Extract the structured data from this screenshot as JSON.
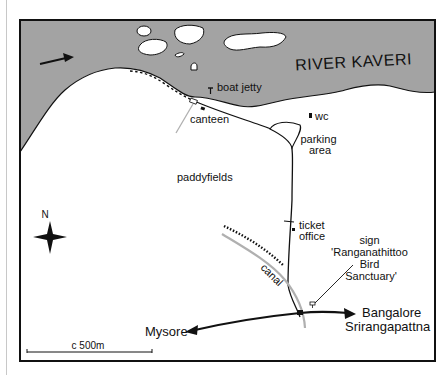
{
  "map": {
    "river_label": "RIVER KAVERI",
    "labels": {
      "boat_jetty": "boat jetty",
      "canteen": "canteen",
      "wc": "wc",
      "parking_1": "parking",
      "parking_2": "area",
      "paddyfields": "paddyfields",
      "ticket_1": "ticket",
      "ticket_2": "office",
      "sign_1": "sign",
      "sign_2": "'Ranganathittoo",
      "sign_3": "Bird",
      "sign_4": "Sanctuary'",
      "canal": "canal",
      "mysore": "Mysore",
      "bangalore": "Bangalore",
      "srirangapattna": "Srirangapattna"
    },
    "compass": {
      "north_label": "N"
    },
    "scale": {
      "label": "c 500m"
    },
    "colors": {
      "water": "#a3a3a3",
      "land": "#ffffff",
      "ink": "#111111",
      "canal": "#b0b0b0"
    }
  }
}
